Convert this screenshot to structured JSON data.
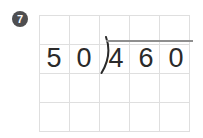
{
  "problem_number": "7",
  "division": {
    "divisor": "50",
    "dividend": "460",
    "divisor_digits": [
      "5",
      "0"
    ],
    "dividend_digits": [
      "4",
      "6",
      "0"
    ],
    "bracket_symbol": ")"
  },
  "grid": {
    "columns": 5,
    "rows": 4
  },
  "colors": {
    "background": "#ffffff",
    "badge_bg": "#4e4e50",
    "badge_text": "#ffffff",
    "grid_line": "#dfdfdf",
    "digit": "#2a2a2a",
    "vinculum": "#8f8f8f"
  }
}
